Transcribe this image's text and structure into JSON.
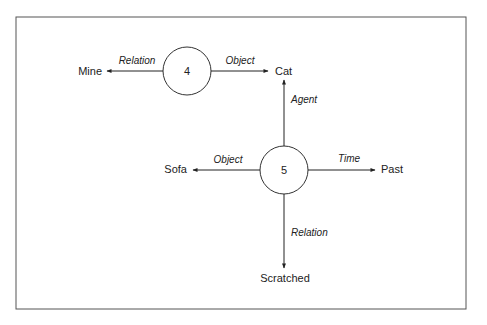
{
  "diagram": {
    "frame": {
      "stroke": "#555555"
    },
    "nodes": {
      "n4": {
        "label": "4"
      },
      "n5": {
        "label": "5"
      },
      "mine": {
        "label": "Mine"
      },
      "cat": {
        "label": "Cat"
      },
      "sofa": {
        "label": "Sofa"
      },
      "past": {
        "label": "Past"
      },
      "scratched": {
        "label": "Scratched"
      }
    },
    "edges": [
      {
        "from": "4",
        "to": "Mine",
        "label": "Relation"
      },
      {
        "from": "4",
        "to": "Cat",
        "label": "Object"
      },
      {
        "from": "5",
        "to": "Cat",
        "label": "Agent"
      },
      {
        "from": "5",
        "to": "Sofa",
        "label": "Object"
      },
      {
        "from": "5",
        "to": "Past",
        "label": "Time"
      },
      {
        "from": "5",
        "to": "Scratched",
        "label": "Relation"
      }
    ]
  }
}
